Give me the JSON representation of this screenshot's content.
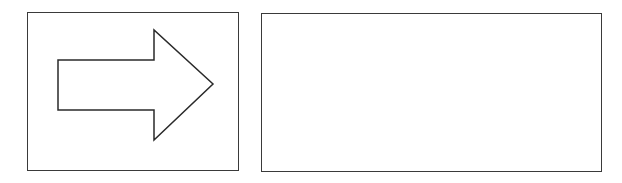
{
  "diagram": {
    "panels": [
      {
        "id": "left",
        "content": "right-arrow"
      },
      {
        "id": "right",
        "content": "empty"
      }
    ],
    "arrow": {
      "direction": "right",
      "points": "58,60 154,60 154,30 213,84 154,140 154,110 58,110",
      "stroke": "#2a2a2a",
      "fill": "#ffffff"
    },
    "colors": {
      "border": "#3a3a3a",
      "background": "#ffffff"
    }
  }
}
